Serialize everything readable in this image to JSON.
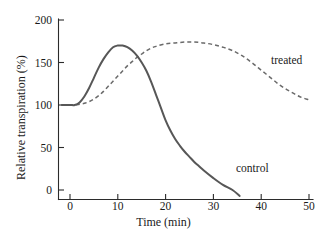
{
  "chart_data": {
    "type": "line",
    "title": "",
    "xlabel": "Time (min)",
    "ylabel": "Relative transpiration (%)",
    "xlim": [
      -2.5,
      51
    ],
    "ylim": [
      -12,
      205
    ],
    "xticks": [
      0,
      10,
      20,
      30,
      40,
      50
    ],
    "xtick_labels": [
      "0",
      "10",
      "20",
      "30",
      "40",
      "50"
    ],
    "yticks": [
      0,
      50,
      100,
      150,
      200
    ],
    "ytick_labels": [
      "0",
      "50",
      "100",
      "150",
      "200"
    ],
    "grid": false,
    "legend": "inline-annotations",
    "series": [
      {
        "name": "control",
        "style": "solid",
        "color": "#575757",
        "label_text": "control",
        "x": [
          -1.7,
          0,
          1,
          2,
          3,
          4,
          5,
          6,
          7,
          8,
          9,
          10,
          10.5,
          11,
          12,
          13,
          14,
          15,
          16,
          17,
          18,
          19,
          20,
          21,
          22,
          23,
          24,
          25,
          26,
          27,
          28,
          30,
          32,
          34,
          35.5
        ],
        "values": [
          100,
          100,
          100,
          103,
          110,
          120,
          132,
          144,
          154,
          162,
          168,
          170,
          170,
          170,
          168,
          164,
          158,
          150,
          140,
          127,
          112,
          97,
          82,
          70,
          60,
          52,
          45,
          39,
          33,
          28,
          23,
          14,
          6,
          0,
          -7
        ]
      },
      {
        "name": "treated",
        "style": "dashed",
        "color": "#6a6a6a",
        "label_text": "treated",
        "x": [
          -1.7,
          0,
          1,
          2,
          3,
          4,
          5,
          6,
          7,
          8,
          9,
          10,
          11,
          12,
          13,
          14,
          15,
          16,
          17,
          18,
          20,
          22,
          24,
          26,
          28,
          30,
          32,
          34,
          36,
          38,
          40,
          42,
          44,
          46,
          48,
          50
        ],
        "values": [
          100,
          100,
          100,
          101,
          102,
          104,
          107,
          111,
          116,
          122,
          128,
          134,
          140,
          146,
          151,
          156,
          160,
          164,
          167,
          169,
          172,
          173,
          174,
          174,
          173,
          171,
          168,
          164,
          158,
          150,
          141,
          132,
          123,
          116,
          110,
          106
        ]
      }
    ]
  },
  "axes": {
    "y_title": "Relative transpiration (%)",
    "x_title": "Time (min)"
  },
  "annotations": {
    "control_label": "control",
    "treated_label": "treated"
  },
  "colors": {
    "control_stroke": "#575757",
    "treated_stroke": "#6a6a6a",
    "axis": "#2b2b2b",
    "text": "#1a1a1a",
    "background": "#ffffff"
  }
}
